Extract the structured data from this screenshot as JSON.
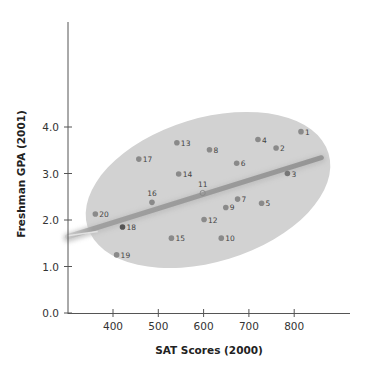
{
  "chart_data": {
    "type": "scatter",
    "title": "",
    "xlabel": "SAT Scores (2000)",
    "ylabel": "Freshman GPA (2001)",
    "xlim": [
      300,
      900
    ],
    "ylim": [
      0.0,
      5.5
    ],
    "x_ticks": [
      400,
      500,
      600,
      700,
      800
    ],
    "x_tick_labels": [
      "400",
      "500",
      "600",
      "700",
      "800"
    ],
    "y_ticks": [
      0.0,
      1.0,
      2.0,
      3.0,
      4.0
    ],
    "y_tick_labels": [
      "0.0",
      "1.0",
      "2.0",
      "3.0",
      "4.0"
    ],
    "grid": false,
    "legend": null,
    "points": [
      {
        "label": "1",
        "x": 815,
        "y": 3.9
      },
      {
        "label": "2",
        "x": 760,
        "y": 3.55
      },
      {
        "label": "3",
        "x": 785,
        "y": 3.0
      },
      {
        "label": "4",
        "x": 720,
        "y": 3.73
      },
      {
        "label": "5",
        "x": 728,
        "y": 2.36
      },
      {
        "label": "6",
        "x": 673,
        "y": 3.22
      },
      {
        "label": "7",
        "x": 675,
        "y": 2.45
      },
      {
        "label": "8",
        "x": 613,
        "y": 3.51
      },
      {
        "label": "9",
        "x": 649,
        "y": 2.27
      },
      {
        "label": "10",
        "x": 639,
        "y": 1.61
      },
      {
        "label": "11",
        "x": 598,
        "y": 2.58
      },
      {
        "label": "12",
        "x": 601,
        "y": 2.01
      },
      {
        "label": "13",
        "x": 541,
        "y": 3.66
      },
      {
        "label": "14",
        "x": 545,
        "y": 2.99
      },
      {
        "label": "15",
        "x": 529,
        "y": 1.61
      },
      {
        "label": "16",
        "x": 486,
        "y": 2.38
      },
      {
        "label": "17",
        "x": 457,
        "y": 3.31
      },
      {
        "label": "18",
        "x": 421,
        "y": 1.85
      },
      {
        "label": "19",
        "x": 408,
        "y": 1.25
      },
      {
        "label": "20",
        "x": 361,
        "y": 2.13
      }
    ],
    "trend_line": {
      "x": [
        300,
        860
      ],
      "y": [
        1.64,
        3.34
      ]
    },
    "annotations": [
      "Shaded ellipse encloses the point cloud",
      "Thick gray regression line with positive slope"
    ]
  },
  "colors": {
    "point": "#8a8a8a",
    "ellipse": "#d2d2d2",
    "trend_line": "#9a9a9a",
    "axis": "#555555"
  }
}
